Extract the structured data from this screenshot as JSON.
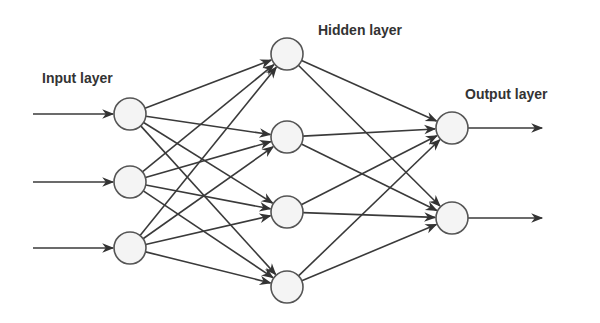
{
  "labels": {
    "input": "Input layer",
    "hidden": "Hidden layer",
    "output": "Output layer"
  },
  "colors": {
    "edge": "#3a3a3a",
    "node_stroke": "#555555",
    "node_fill": "#f4f4f4",
    "text": "#333333"
  },
  "layers": {
    "input": {
      "count": 3,
      "nodes": [
        [
          130,
          114
        ],
        [
          130,
          182
        ],
        [
          130,
          248
        ]
      ]
    },
    "hidden": {
      "count": 4,
      "nodes": [
        [
          287,
          54
        ],
        [
          287,
          137
        ],
        [
          287,
          212
        ],
        [
          287,
          287
        ]
      ]
    },
    "output": {
      "count": 2,
      "nodes": [
        [
          452,
          128
        ],
        [
          452,
          218
        ]
      ]
    }
  },
  "node_radius": 16
}
